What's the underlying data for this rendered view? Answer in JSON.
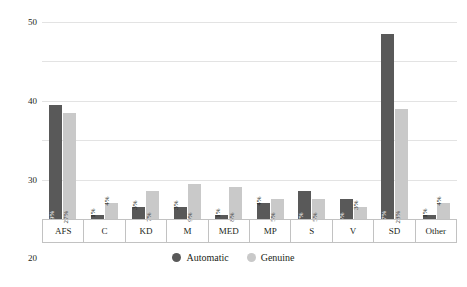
{
  "chart_data": {
    "type": "bar",
    "title": "",
    "xlabel": "",
    "ylabel": "Proportion of party support, %",
    "ylim": [
      0,
      50
    ],
    "yticks": [
      0,
      10,
      20,
      30,
      40,
      50
    ],
    "grid": true,
    "legend_position": "bottom-center",
    "categories": [
      "AFS",
      "C",
      "KD",
      "M",
      "MED",
      "MP",
      "S",
      "V",
      "SD",
      "Other"
    ],
    "series": [
      {
        "name": "Automatic",
        "color": "#595959",
        "values": [
          29,
          1,
          3,
          3,
          1,
          4,
          7,
          5,
          47,
          1
        ],
        "labels": [
          "29%",
          "1%",
          "3%",
          "3%",
          "1%",
          "4%",
          "7%",
          "5%",
          "47%",
          "1%"
        ]
      },
      {
        "name": "Genuine",
        "color": "#c9c9c9",
        "values": [
          27,
          4,
          7,
          9,
          8,
          5,
          5,
          3,
          28,
          4
        ],
        "labels": [
          "27%",
          "4%",
          "7%",
          "9%",
          "8%",
          "5%",
          "5%",
          "3%",
          "28%",
          "4%"
        ]
      }
    ]
  },
  "axis": {
    "y_title": "Proportion of party support, %",
    "y_tick_labels": [
      "0",
      "10",
      "20",
      "30",
      "40",
      "50"
    ]
  },
  "legend": {
    "items": [
      {
        "label": "Automatic",
        "color": "#595959"
      },
      {
        "label": "Genuine",
        "color": "#c9c9c9"
      }
    ]
  }
}
